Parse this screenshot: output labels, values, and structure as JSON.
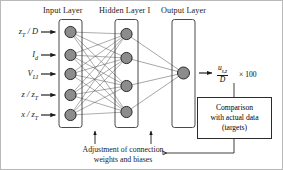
{
  "figure": {
    "background_color": "#ffffff",
    "node_fill": "#8c8c8c",
    "node_stroke": "#2b2b2b",
    "line_color": "#3a3a3a",
    "border_color": "#b9b9b9"
  },
  "layers": {
    "input": {
      "title": "Input Layer",
      "node_count": 5,
      "labels": [
        {
          "base": "z",
          "sub": "T",
          "rest": " / D",
          "text": "zT / D"
        },
        {
          "base": "I",
          "sub": "d",
          "rest": "",
          "text": "Id"
        },
        {
          "base": "V",
          "sub": "LI",
          "rest": "",
          "text": "VLI"
        },
        {
          "base": "z / z",
          "sub": "T",
          "rest": "",
          "text": "z / zT"
        },
        {
          "base": "x / z",
          "sub": "T",
          "rest": "",
          "text": "x / zT"
        }
      ]
    },
    "hidden": {
      "title": "Hidden Layer I",
      "node_count": 4
    },
    "output": {
      "title": "Output Layer",
      "node_count": 1
    }
  },
  "output_expression": {
    "numerator_base": "u",
    "numerator_sub": "s,z",
    "denominator": "D",
    "multiplier": "× 100"
  },
  "comparison_box": {
    "line1": "Comparison",
    "line2": "with actual data",
    "line3": "(targets)"
  },
  "caption": {
    "line1": "Adjustment of connection",
    "line2": "weights and biases"
  }
}
